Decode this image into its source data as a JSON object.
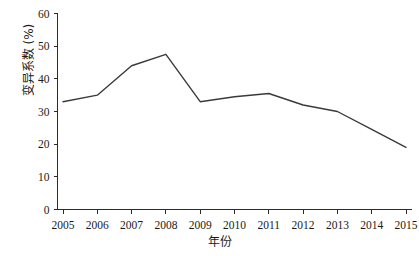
{
  "chart_data": {
    "type": "line",
    "title": "",
    "subtitle": "",
    "xlabel": "年份",
    "ylabel": "变异系数 (%)",
    "categories": [
      "2005",
      "2006",
      "2007",
      "2008",
      "2009",
      "2010",
      "2011",
      "2012",
      "2013",
      "2014",
      "2015"
    ],
    "x": [
      2005,
      2006,
      2007,
      2008,
      2009,
      2010,
      2011,
      2012,
      2013,
      2014,
      2015
    ],
    "values": [
      33.0,
      35.0,
      44.0,
      47.5,
      33.0,
      34.5,
      35.5,
      32.0,
      30.0,
      24.5,
      19.0
    ],
    "series": [
      {
        "name": "变异系数",
        "values": [
          33.0,
          35.0,
          44.0,
          47.5,
          33.0,
          34.5,
          35.5,
          32.0,
          30.0,
          24.5,
          19.0
        ],
        "color": "#3a3a3a",
        "marker": "none"
      }
    ],
    "ylim": [
      0,
      60
    ],
    "yticks": [
      0,
      10,
      20,
      30,
      40,
      50,
      60
    ],
    "ytick_labels": [
      "0",
      "10",
      "20",
      "30",
      "40",
      "50",
      "60"
    ],
    "xtick_labels": [
      "2005",
      "2006",
      "2007",
      "2008",
      "2009",
      "2010",
      "2011",
      "2012",
      "2013",
      "2014",
      "2015"
    ],
    "grid": false,
    "legend": false,
    "legend_position": "none",
    "annotations": []
  },
  "axes": {
    "y_axis_title": "变异系数 (%)",
    "x_axis_title": "年份"
  },
  "colors": {
    "line": "#3a3a3a",
    "axis": "#2b2b2b",
    "text": "#1a1a1a",
    "background": "#ffffff"
  }
}
